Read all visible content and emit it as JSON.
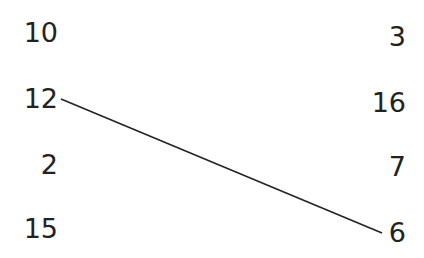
{
  "left_column": [
    {
      "label": "10",
      "top": 18
    },
    {
      "label": "12",
      "top": 84
    },
    {
      "label": "2",
      "top": 150
    },
    {
      "label": "15",
      "top": 214
    }
  ],
  "right_column": [
    {
      "label": "3",
      "top": 22
    },
    {
      "label": "16",
      "top": 88
    },
    {
      "label": "7",
      "top": 152
    },
    {
      "label": "6",
      "top": 218
    }
  ],
  "connections": [
    {
      "from": "12",
      "to": "6",
      "x1": 61,
      "y1": 99,
      "x2": 382,
      "y2": 233
    }
  ],
  "colors": {
    "text": "#222222",
    "line": "#222222"
  }
}
